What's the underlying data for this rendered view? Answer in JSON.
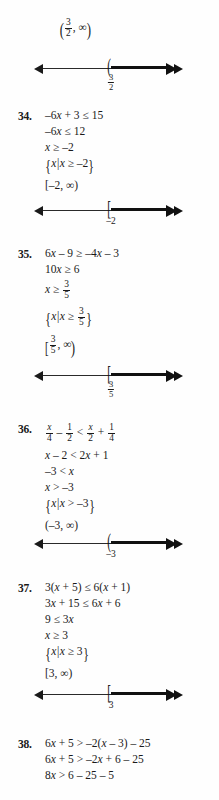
{
  "document": {
    "type": "math-answer-key-page",
    "ink_color": "#1a1a1a",
    "paper_color": "#fefefe"
  },
  "top_partial": {
    "interval_label": "( 3/2 , ∞ )",
    "numberline": {
      "endpoint_symbol": "(",
      "endpoint_label": "3/2",
      "direction": "right",
      "left_arrow": "◀",
      "right_arrow": "▶"
    }
  },
  "problems": [
    {
      "number": "34.",
      "steps": [
        "–6x + 3 ≤ 15",
        "–6x ≤ 12",
        "x ≥ –2",
        "{x | x ≥ –2}",
        "[–2, ∞)"
      ],
      "numberline": {
        "endpoint_symbol": "[",
        "endpoint_label": "–2",
        "direction": "right"
      }
    },
    {
      "number": "35.",
      "steps": [
        "6x – 9 ≥ –4x – 3",
        "10x ≥ 6",
        "x ≥ 3/5",
        "{x | x ≥ 3/5}",
        "[3/5, ∞)"
      ],
      "numberline": {
        "endpoint_symbol": "[",
        "endpoint_label": "3/5",
        "direction": "right"
      }
    },
    {
      "number": "36.",
      "steps": [
        "x/4 – 1/2 < x/2 + 1/4",
        "x – 2 < 2x + 1",
        "–3 < x",
        "x > –3",
        "{x | x > –3}",
        "(–3, ∞)"
      ],
      "numberline": {
        "endpoint_symbol": "(",
        "endpoint_label": "–3",
        "direction": "right"
      }
    },
    {
      "number": "37.",
      "steps": [
        "3(x + 5) ≤ 6(x + 1)",
        "3x + 15 ≤ 6x + 6",
        "9 ≤ 3x",
        "x ≥ 3",
        "{x | x ≥ 3}",
        "[3, ∞)"
      ],
      "numberline": {
        "endpoint_symbol": "[",
        "endpoint_label": "3",
        "direction": "right"
      }
    },
    {
      "number": "38.",
      "steps": [
        "6x + 5 > –2(x – 3) – 25",
        "6x + 5 > –2x + 6 – 25",
        "8x > 6 – 25 – 5"
      ],
      "numberline": null
    }
  ]
}
